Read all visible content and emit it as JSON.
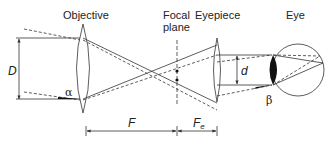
{
  "diagram": {
    "labels": {
      "objective": "Objective",
      "focal_plane_line1": "Focal",
      "focal_plane_line2": "plane",
      "eyepiece": "Eyepiece",
      "eye": "Eye"
    },
    "symbols": {
      "D": "D",
      "d": "d",
      "alpha": "α",
      "beta": "β",
      "F": "F",
      "Fe": "F",
      "Fe_sub": "e"
    },
    "colors": {
      "line": "#333333",
      "fill_dark": "#111111"
    }
  }
}
